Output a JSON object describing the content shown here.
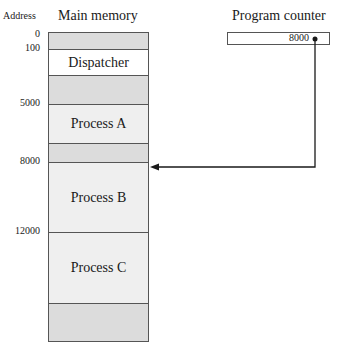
{
  "diagram": {
    "address_label": "Address",
    "memory_title": "Main memory",
    "program_counter": {
      "title": "Program counter",
      "value": "8000"
    },
    "addresses": [
      {
        "label": "0",
        "y": 30
      },
      {
        "label": "100",
        "y": 46
      },
      {
        "label": "5000",
        "y": 101
      },
      {
        "label": "8000",
        "y": 159
      },
      {
        "label": "12000",
        "y": 229
      }
    ],
    "segments": [
      {
        "label": "",
        "top": 0,
        "height": 16,
        "color": "#dcdcdc"
      },
      {
        "label": "Dispatcher",
        "top": 16,
        "height": 26,
        "color": "#ffffff"
      },
      {
        "label": "",
        "top": 42,
        "height": 29,
        "color": "#dcdcdc"
      },
      {
        "label": "Process A",
        "top": 71,
        "height": 39,
        "color": "#efefef"
      },
      {
        "label": "",
        "top": 110,
        "height": 19,
        "color": "#dcdcdc"
      },
      {
        "label": "Process B",
        "top": 129,
        "height": 70,
        "color": "#efefef"
      },
      {
        "label": "Process C",
        "top": 199,
        "height": 71,
        "color": "#efefef"
      },
      {
        "label": "",
        "top": 270,
        "height": 39,
        "color": "#dcdcdc"
      }
    ],
    "colors": {
      "line": "#555555",
      "free_region": "#dcdcdc",
      "process_region": "#efefef",
      "dispatcher_region": "#ffffff"
    }
  }
}
